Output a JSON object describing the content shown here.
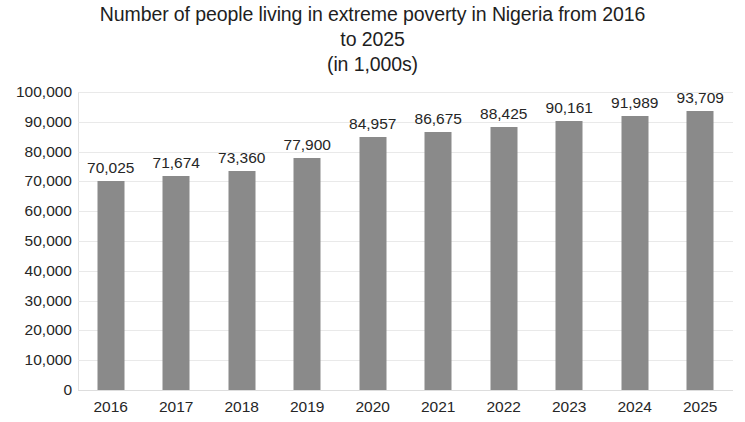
{
  "chart_data": {
    "type": "bar",
    "title": "Number of people living in extreme poverty in Nigeria from 2016 to 2025 (in 1,000s)",
    "title_lines": [
      "Number of people living in extreme poverty in Nigeria from 2016",
      "to 2025",
      "(in 1,000s)"
    ],
    "subtitle": "(in 1,000s)",
    "xlabel": "",
    "ylabel": "",
    "categories": [
      "2016",
      "2017",
      "2018",
      "2019",
      "2020",
      "2021",
      "2022",
      "2023",
      "2024",
      "2025"
    ],
    "values": [
      70025,
      71674,
      73360,
      77900,
      84957,
      86675,
      88425,
      90161,
      91989,
      93709
    ],
    "value_labels": [
      "70,025",
      "71,674",
      "73,360",
      "77,900",
      "84,957",
      "86,675",
      "88,425",
      "90,161",
      "91,989",
      "93,709"
    ],
    "ylim": [
      0,
      100000
    ],
    "ytick_values": [
      0,
      10000,
      20000,
      30000,
      40000,
      50000,
      60000,
      70000,
      80000,
      90000,
      100000
    ],
    "ytick_labels": [
      "0",
      "10,000",
      "20,000",
      "30,000",
      "40,000",
      "50,000",
      "60,000",
      "70,000",
      "80,000",
      "90,000",
      "100,000"
    ],
    "grid": true,
    "grid_axis": "y",
    "legend": false,
    "legend_position": "none",
    "bar_color": "#8a8a8a",
    "gridline_color": "#e9e9e9",
    "background_color": "#ffffff",
    "text_color": "#262626",
    "data_labels_shown": true,
    "data_label_position": "above-bar"
  }
}
